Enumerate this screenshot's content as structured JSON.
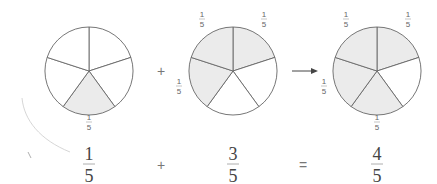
{
  "pies": [
    {
      "id": "pie-1",
      "cx": 89,
      "cy": 71,
      "r": 44,
      "slices": 5,
      "shaded": [
        2
      ],
      "labels": [
        {
          "text_num": "1",
          "text_den": "5",
          "x": 89,
          "y": 123
        }
      ]
    },
    {
      "id": "pie-2",
      "cx": 233,
      "cy": 71,
      "r": 44,
      "slices": 5,
      "shaded": [
        0,
        4,
        3
      ],
      "labels": [
        {
          "text_num": "1",
          "text_den": "5",
          "x": 202,
          "y": 20
        },
        {
          "text_num": "1",
          "text_den": "5",
          "x": 264,
          "y": 20
        },
        {
          "text_num": "1",
          "text_den": "5",
          "x": 179,
          "y": 87
        }
      ]
    },
    {
      "id": "pie-3",
      "cx": 377,
      "cy": 71,
      "r": 44,
      "slices": 5,
      "shaded": [
        0,
        4,
        3,
        2
      ],
      "labels": [
        {
          "text_num": "1",
          "text_den": "5",
          "x": 346,
          "y": 20
        },
        {
          "text_num": "1",
          "text_den": "5",
          "x": 408,
          "y": 20
        },
        {
          "text_num": "1",
          "text_den": "5",
          "x": 324,
          "y": 87
        },
        {
          "text_num": "1",
          "text_den": "5",
          "x": 377,
          "y": 123
        }
      ]
    }
  ],
  "operators": {
    "plus_top": "+",
    "arrow": "→"
  },
  "equation": {
    "term1": {
      "num": "1",
      "den": "5"
    },
    "op1": "+",
    "term2": {
      "num": "3",
      "den": "5"
    },
    "op2": "=",
    "result": {
      "num": "4",
      "den": "5"
    }
  },
  "colors": {
    "shade": "#ebebeb",
    "stroke": "#666666",
    "text": "#444444"
  }
}
